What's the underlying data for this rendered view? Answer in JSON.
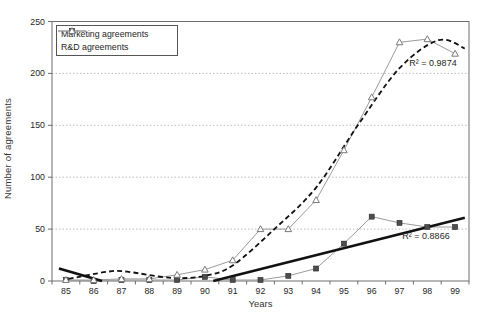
{
  "chart_data": {
    "type": "line",
    "title": "",
    "xlabel": "Years",
    "ylabel": "Number of agreements",
    "x_categories": [
      "85",
      "86",
      "87",
      "88",
      "89",
      "90",
      "91",
      "92",
      "93",
      "94",
      "95",
      "96",
      "97",
      "98",
      "99"
    ],
    "y_ticks": [
      0,
      50,
      100,
      150,
      200,
      250
    ],
    "ylim": [
      0,
      250
    ],
    "grid": "horizontal dotted gridlines at 50,100,150,200",
    "legend_position": "top-left inside plot",
    "colors": {
      "series_line": "#9a9a9a",
      "marketing_marker": "#4d4d4d",
      "rd_marker_fill": "#ffffff",
      "rd_marker_stroke": "#7a7a7a",
      "trend": "#111111",
      "gridline": "#bdbdbd",
      "frame": "#6e6e6e",
      "text": "#262626"
    },
    "series": [
      {
        "name": "Marketing agreements",
        "marker": "filled-square",
        "values": [
          1,
          0,
          1,
          1,
          1,
          4,
          1,
          1,
          5,
          12,
          36,
          62,
          56,
          52,
          52
        ]
      },
      {
        "name": "R&D agreements",
        "marker": "open-triangle",
        "values": [
          1,
          1,
          2,
          2,
          6,
          11,
          20,
          50,
          50,
          78,
          126,
          177,
          230,
          233,
          219
        ]
      }
    ],
    "trendlines": [
      {
        "for": "R&D agreements",
        "style": "dashed",
        "r2_label": "R² = 0.9874",
        "points": [
          [
            85.1,
            2
          ],
          [
            86.5,
            9
          ],
          [
            87.2,
            9
          ],
          [
            88.8,
            3
          ],
          [
            90,
            5
          ],
          [
            91,
            15
          ],
          [
            92.5,
            50
          ],
          [
            94,
            90
          ],
          [
            95.5,
            150
          ],
          [
            97,
            205
          ],
          [
            98.4,
            232
          ],
          [
            99.35,
            224
          ]
        ]
      },
      {
        "for": "Marketing agreements",
        "style": "solid-thick (clipped below 0 between 86.3 and 90.3)",
        "r2_label": "R² = 0.8866",
        "segments": [
          [
            [
              84.75,
              12
            ],
            [
              86.3,
              0
            ]
          ],
          [
            [
              90.3,
              0
            ],
            [
              99.35,
              61
            ]
          ]
        ]
      }
    ]
  }
}
